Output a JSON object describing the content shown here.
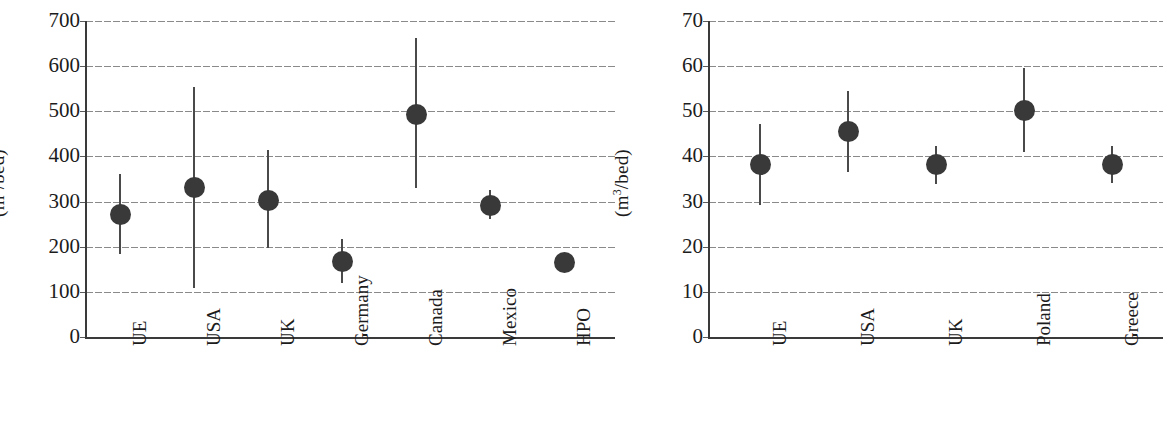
{
  "chart_data": [
    {
      "type": "scatter",
      "panel": "left",
      "title": "",
      "xlabel": "",
      "ylabel": "(m3/bed)",
      "ylabel_base": "(m",
      "ylabel_sup": "3",
      "ylabel_tail": "/bed)",
      "ylim": [
        0,
        700
      ],
      "ytick_step": 100,
      "yticks": [
        700,
        600,
        500,
        400,
        300,
        200,
        100,
        0
      ],
      "grid": true,
      "grid_style": "dotted",
      "legend": "none",
      "categories": [
        "UE",
        "USA",
        "UK",
        "Germany",
        "Canada",
        "Mexico",
        "HPO"
      ],
      "values": [
        272,
        332,
        303,
        168,
        493,
        292,
        165
      ],
      "lower": [
        183,
        108,
        197,
        120,
        330,
        262,
        147
      ],
      "upper": [
        362,
        553,
        415,
        218,
        663,
        325,
        185
      ]
    },
    {
      "type": "scatter",
      "panel": "right",
      "title": "",
      "xlabel": "",
      "ylabel": "(m3/bed)",
      "ylabel_base": "(m",
      "ylabel_sup": "3",
      "ylabel_tail": "/bed)",
      "ylim": [
        0,
        70
      ],
      "ytick_step": 10,
      "yticks": [
        70,
        60,
        50,
        40,
        30,
        20,
        10,
        0
      ],
      "grid": true,
      "grid_style": "dotted",
      "legend": "none",
      "categories": [
        "UE",
        "USA",
        "UK",
        "Poland",
        "Greece"
      ],
      "values": [
        38.2,
        45.6,
        38.2,
        50.2,
        38.2
      ],
      "lower": [
        29.3,
        36.5,
        34.0,
        41.0,
        34.2
      ],
      "upper": [
        47.2,
        54.5,
        42.2,
        59.5,
        42.2
      ]
    }
  ],
  "left_panel": {
    "axis_title_base": "(m",
    "axis_title_sup": "3",
    "axis_title_tail": "/bed)",
    "ytick_labels": [
      "700",
      "600",
      "500",
      "400",
      "300",
      "200",
      "100",
      "0"
    ],
    "xtick_labels": [
      "UE",
      "USA",
      "UK",
      "Germany",
      "Canada",
      "Mexico",
      "HPO"
    ]
  },
  "right_panel": {
    "axis_title_base": "(m",
    "axis_title_sup": "3",
    "axis_title_tail": "/bed)",
    "ytick_labels": [
      "70",
      "60",
      "50",
      "40",
      "30",
      "20",
      "10",
      "0"
    ],
    "xtick_labels": [
      "UE",
      "USA",
      "UK",
      "Poland",
      "Greece"
    ]
  },
  "style": {
    "marker_color": "#393939",
    "whisker_color": "#4a4a4a",
    "axis_color": "#3a3a3a",
    "grid_color": "#8a8a8a",
    "text_color": "#1c1c1c",
    "background": "#ffffff"
  }
}
